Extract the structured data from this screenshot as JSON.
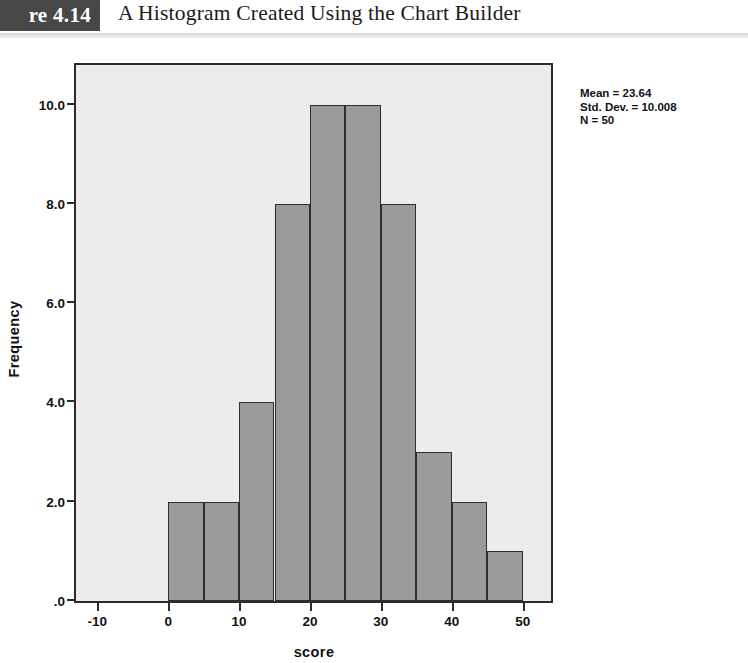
{
  "figure": {
    "number_label": "re 4.14",
    "caption": "A Histogram Created Using the Chart Builder"
  },
  "stats": {
    "mean_line": "Mean = 23.64",
    "std_dev_line": "Std. Dev. = 10.008",
    "n_line": "N = 50"
  },
  "chart_data": {
    "type": "bar",
    "title": "",
    "xlabel": "score",
    "ylabel": "Frequency",
    "xlim": [
      -13,
      54
    ],
    "ylim": [
      0,
      10.8
    ],
    "bin_width": 5,
    "grid": false,
    "legend": null,
    "x_ticks": [
      -10,
      0,
      10,
      20,
      30,
      40,
      50
    ],
    "x_tick_labels": [
      "-10",
      "0",
      "10",
      "20",
      "30",
      "40",
      "50"
    ],
    "y_ticks": [
      0,
      2,
      4,
      6,
      8,
      10
    ],
    "y_tick_labels": [
      ".0",
      "2.0",
      "4.0",
      "6.0",
      "8.0",
      "10.0"
    ],
    "bins": [
      {
        "start": 0,
        "end": 5,
        "count": 2
      },
      {
        "start": 5,
        "end": 10,
        "count": 2
      },
      {
        "start": 10,
        "end": 15,
        "count": 4
      },
      {
        "start": 15,
        "end": 20,
        "count": 8
      },
      {
        "start": 20,
        "end": 25,
        "count": 10
      },
      {
        "start": 25,
        "end": 30,
        "count": 10
      },
      {
        "start": 30,
        "end": 35,
        "count": 8
      },
      {
        "start": 35,
        "end": 40,
        "count": 3
      },
      {
        "start": 40,
        "end": 45,
        "count": 2
      },
      {
        "start": 45,
        "end": 50,
        "count": 1
      }
    ],
    "categories": [
      "0-5",
      "5-10",
      "10-15",
      "15-20",
      "20-25",
      "25-30",
      "30-35",
      "35-40",
      "40-45",
      "45-50"
    ],
    "values": [
      2,
      2,
      4,
      8,
      10,
      10,
      8,
      3,
      2,
      1
    ],
    "annotations": [
      "Mean = 23.64",
      "Std. Dev. = 10.008",
      "N = 50"
    ],
    "colors": {
      "bar_fill": "#9a9a9a",
      "bar_border": "#2e2e2e",
      "plot_background": "#ececec",
      "axis": "#2b2b2b"
    }
  }
}
